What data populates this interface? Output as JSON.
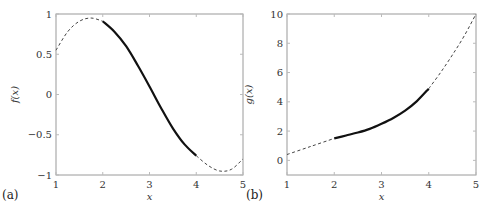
{
  "chart_data": [
    {
      "type": "line",
      "panel_label": "(a)",
      "title": "",
      "xlabel": "x",
      "ylabel": "f(x)",
      "xlim": [
        1,
        5
      ],
      "ylim": [
        -1,
        1
      ],
      "xticks": [
        "1",
        "2",
        "3",
        "4",
        "5"
      ],
      "yticks": [
        "−1",
        "−0.5",
        "0",
        "0.5",
        "1"
      ],
      "ytick_values": [
        -1,
        -0.5,
        0,
        0.5,
        1
      ],
      "grid": false,
      "series": [
        {
          "name": "f(x) dashed (outside [2,4])",
          "style": "dashed",
          "x": [
            1.0,
            1.25,
            1.5,
            1.75,
            2.0
          ],
          "y": [
            0.55,
            0.78,
            0.91,
            0.95,
            0.91
          ]
        },
        {
          "name": "f(x) solid on [2,4]",
          "style": "solid",
          "x": [
            2.0,
            2.25,
            2.5,
            2.75,
            3.0,
            3.25,
            3.5,
            3.75,
            4.0
          ],
          "y": [
            0.91,
            0.78,
            0.6,
            0.36,
            0.1,
            -0.17,
            -0.42,
            -0.62,
            -0.76
          ]
        },
        {
          "name": "f(x) dashed (outside [2,4])",
          "style": "dashed",
          "x": [
            4.0,
            4.25,
            4.5,
            4.75,
            5.0
          ],
          "y": [
            -0.76,
            -0.88,
            -0.95,
            -0.93,
            -0.8
          ]
        }
      ]
    },
    {
      "type": "line",
      "panel_label": "(b)",
      "title": "",
      "xlabel": "x",
      "ylabel": "g(x)",
      "xlim": [
        1,
        5
      ],
      "ylim": [
        -1,
        10
      ],
      "xticks": [
        "1",
        "2",
        "3",
        "4",
        "5"
      ],
      "yticks": [
        "0",
        "2",
        "4",
        "6",
        "8",
        "10"
      ],
      "ytick_values": [
        0,
        2,
        4,
        6,
        8,
        10
      ],
      "grid": false,
      "series": [
        {
          "name": "g(x) dashed (outside [2,4])",
          "style": "dashed",
          "x": [
            1.0,
            1.5,
            2.0
          ],
          "y": [
            0.4,
            0.95,
            1.5
          ]
        },
        {
          "name": "g(x) solid on [2,4]",
          "style": "solid",
          "x": [
            2.0,
            2.25,
            2.5,
            2.75,
            3.0,
            3.25,
            3.5,
            3.75,
            4.0
          ],
          "y": [
            1.5,
            1.7,
            1.9,
            2.15,
            2.5,
            2.9,
            3.4,
            4.05,
            4.9
          ]
        },
        {
          "name": "g(x) dashed (outside [2,4])",
          "style": "dashed",
          "x": [
            4.0,
            4.25,
            4.5,
            4.75,
            5.0
          ],
          "y": [
            4.9,
            6.0,
            7.2,
            8.5,
            10.0
          ]
        }
      ]
    }
  ]
}
